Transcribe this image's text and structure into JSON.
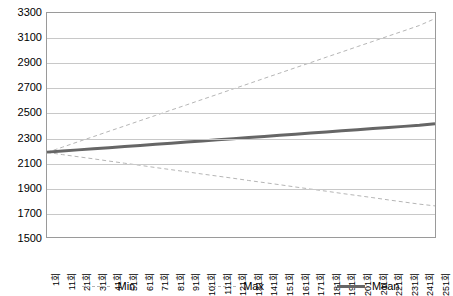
{
  "chart_data": {
    "type": "line",
    "title": "",
    "xlabel": "",
    "ylabel": "",
    "ylim": [
      1500,
      3300
    ],
    "ytick_step": 200,
    "yticks": [
      3300,
      3100,
      2900,
      2700,
      2500,
      2300,
      2100,
      1900,
      1700,
      1500
    ],
    "grid": true,
    "legend_position": "bottom",
    "x": [
      "1회",
      "11회",
      "21회",
      "31회",
      "41회",
      "51회",
      "61회",
      "71회",
      "81회",
      "91회",
      "101회",
      "111회",
      "121회",
      "131회",
      "141회",
      "151회",
      "161회",
      "171회",
      "181회",
      "191회",
      "201회",
      "211회",
      "221회",
      "231회",
      "241회",
      "251회"
    ],
    "series": [
      {
        "name": "Min",
        "style": "dashed",
        "color": "#b4b4b4",
        "width": 1,
        "values": [
          2180,
          2162,
          2145,
          2128,
          2110,
          2093,
          2076,
          2058,
          2041,
          2024,
          2006,
          1989,
          1972,
          1954,
          1937,
          1920,
          1902,
          1885,
          1868,
          1850,
          1833,
          1816,
          1798,
          1781,
          1764,
          1750
        ]
      },
      {
        "name": "Max",
        "style": "dashed",
        "color": "#b4b4b4",
        "width": 1,
        "values": [
          2180,
          2222,
          2265,
          2307,
          2350,
          2392,
          2435,
          2477,
          2520,
          2562,
          2605,
          2647,
          2690,
          2732,
          2775,
          2817,
          2860,
          2902,
          2945,
          2987,
          3030,
          3072,
          3115,
          3157,
          3200,
          3255
        ]
      },
      {
        "name": "Mean",
        "style": "solid",
        "color": "#666666",
        "width": 3,
        "values": [
          2182,
          2191,
          2200,
          2209,
          2218,
          2227,
          2236,
          2245,
          2254,
          2263,
          2272,
          2281,
          2290,
          2299,
          2308,
          2317,
          2326,
          2335,
          2344,
          2353,
          2362,
          2371,
          2380,
          2389,
          2398,
          2410
        ]
      }
    ]
  },
  "legend": {
    "items": [
      {
        "label": "Min",
        "kind": "min"
      },
      {
        "label": "Max",
        "kind": "max"
      },
      {
        "label": "Mean",
        "kind": "mean"
      }
    ]
  },
  "colors": {
    "plot_border": "#9a9a9a",
    "gridline": "#c8c8c8",
    "background": "#ffffff",
    "text": "#000000"
  }
}
